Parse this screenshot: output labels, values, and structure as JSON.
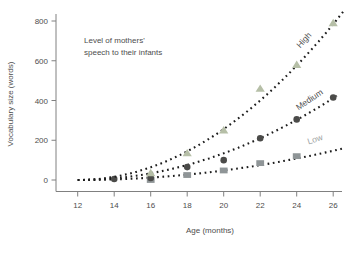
{
  "chart_data": {
    "type": "scatter",
    "title": "",
    "xlabel": "Age (months)",
    "ylabel": "Vocabulary size (words)",
    "annotation_lines": [
      "Level of mothers'",
      "speech to their infants"
    ],
    "x_ticks": [
      12,
      14,
      16,
      18,
      20,
      22,
      24,
      26
    ],
    "y_ticks": [
      0,
      200,
      400,
      600,
      800
    ],
    "xlim": [
      11.3,
      27
    ],
    "ylim": [
      0,
      800
    ],
    "grid": false,
    "legend_position": "labels-on-curves",
    "line_style": "dotted",
    "line_color": "#1c1c1c",
    "axis_color": "#808080",
    "series": [
      {
        "name": "High",
        "marker": "triangle",
        "marker_color": "#b6bfa7",
        "label_color": "#4f4f4f",
        "points": {
          "x": [
            16,
            18,
            20,
            22,
            24,
            26
          ],
          "y": [
            35,
            135,
            250,
            460,
            580,
            790
          ]
        },
        "fit": {
          "type": "quadratic",
          "a": 4.0,
          "x_start": 12,
          "x_end": 26.6
        }
      },
      {
        "name": "Medium",
        "marker": "circle",
        "marker_color": "#4b4b49",
        "label_color": "#4f4f4f",
        "points": {
          "x": [
            14,
            16,
            18,
            20,
            22,
            24,
            26
          ],
          "y": [
            5,
            10,
            65,
            100,
            210,
            305,
            415
          ]
        },
        "fit": {
          "type": "quadratic",
          "a": 2.1,
          "x_start": 12,
          "x_end": 26.2
        }
      },
      {
        "name": "Low",
        "marker": "square",
        "marker_color": "#8f9597",
        "label_color": "#9ba1a1",
        "points": {
          "x": [
            16,
            18,
            20,
            22,
            24
          ],
          "y": [
            0,
            25,
            48,
            85,
            120
          ]
        },
        "fit": {
          "type": "quadratic",
          "a": 0.75,
          "x_start": 12,
          "x_end": 26.7
        }
      }
    ]
  }
}
